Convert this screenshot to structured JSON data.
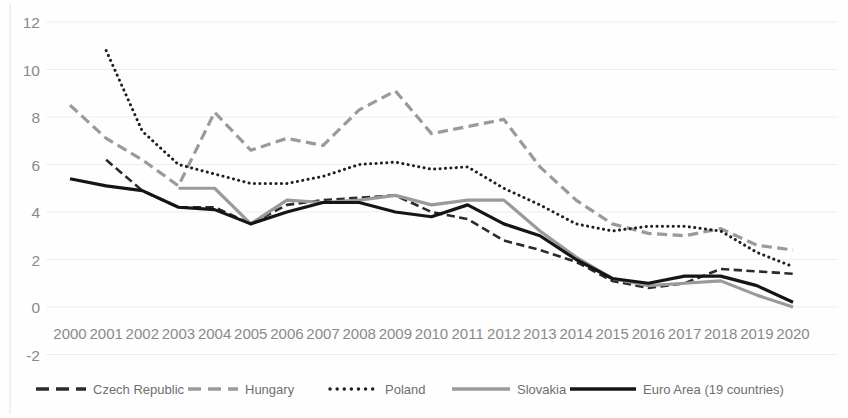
{
  "chart_data": {
    "type": "line",
    "title": "",
    "xlabel": "",
    "ylabel": "",
    "x": [
      2000,
      2001,
      2002,
      2003,
      2004,
      2005,
      2006,
      2007,
      2008,
      2009,
      2010,
      2011,
      2012,
      2013,
      2014,
      2015,
      2016,
      2017,
      2018,
      2019,
      2020
    ],
    "categories": [
      "2000",
      "2001",
      "2002",
      "2003",
      "2004",
      "2005",
      "2006",
      "2007",
      "2008",
      "2009",
      "2010",
      "2011",
      "2012",
      "2013",
      "2014",
      "2015",
      "2016",
      "2017",
      "2018",
      "2019",
      "2020"
    ],
    "ylim": [
      -2,
      12
    ],
    "yticks": [
      12,
      10,
      8,
      6,
      4,
      2,
      0,
      -2
    ],
    "ytick_labels": [
      "12",
      "10",
      "8",
      "6",
      "4",
      "2",
      "0",
      "-2"
    ],
    "grid": true,
    "legend_position": "bottom",
    "series": [
      {
        "name": "Czech Republic",
        "color": "#2b2b2b",
        "style": "dashed",
        "width": 2.6,
        "values": [
          null,
          6.2,
          4.9,
          4.2,
          4.2,
          3.5,
          4.3,
          4.5,
          4.6,
          4.7,
          4.0,
          3.7,
          2.8,
          2.4,
          1.9,
          1.1,
          0.8,
          1.0,
          1.6,
          1.5,
          1.4
        ]
      },
      {
        "name": "Hungary",
        "color": "#9a9a9a",
        "style": "dashed",
        "width": 3.2,
        "values": [
          8.5,
          7.1,
          6.2,
          5.1,
          8.2,
          6.6,
          7.1,
          6.8,
          8.3,
          9.1,
          7.3,
          7.6,
          7.9,
          5.9,
          4.5,
          3.5,
          3.1,
          3.0,
          3.3,
          2.6,
          2.4
        ]
      },
      {
        "name": "Poland",
        "color": "#1f1f1f",
        "style": "dotted",
        "width": 3.0,
        "values": [
          null,
          10.8,
          7.4,
          6.0,
          5.6,
          5.2,
          5.2,
          5.5,
          6.0,
          6.1,
          5.8,
          5.9,
          5.0,
          4.3,
          3.5,
          3.2,
          3.4,
          3.4,
          3.2,
          2.3,
          1.7
        ]
      },
      {
        "name": "Slovakia",
        "color": "#9a9a9a",
        "style": "solid",
        "width": 3.2,
        "values": [
          null,
          null,
          null,
          5.0,
          5.0,
          3.5,
          4.5,
          4.4,
          4.5,
          4.7,
          4.3,
          4.5,
          4.5,
          3.2,
          2.1,
          1.2,
          0.9,
          1.0,
          1.1,
          0.5,
          0.0
        ]
      },
      {
        "name": "Euro Area (19 countries)",
        "color": "#151515",
        "style": "solid",
        "width": 3.2,
        "values": [
          5.4,
          5.1,
          4.9,
          4.2,
          4.1,
          3.5,
          4.0,
          4.4,
          4.4,
          4.0,
          3.8,
          4.3,
          3.5,
          3.0,
          2.0,
          1.2,
          1.0,
          1.3,
          1.3,
          0.9,
          0.2
        ]
      }
    ]
  },
  "legend": {
    "items": [
      {
        "label": "Czech Republic"
      },
      {
        "label": "Hungary"
      },
      {
        "label": "Poland"
      },
      {
        "label": "Slovakia"
      },
      {
        "label": "Euro Area (19 countries)"
      }
    ]
  }
}
